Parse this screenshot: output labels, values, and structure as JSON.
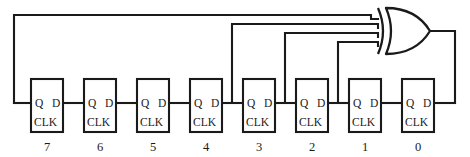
{
  "diagram": {
    "type": "digital-logic-schematic",
    "background_color": "#ffffff",
    "line_color": "#1a1a1a"
  },
  "flipflops": [
    {
      "index_label": "7",
      "q_label": "Q",
      "d_label": "D",
      "clk_label": "CLK"
    },
    {
      "index_label": "6",
      "q_label": "Q",
      "d_label": "D",
      "clk_label": "CLK"
    },
    {
      "index_label": "5",
      "q_label": "Q",
      "d_label": "D",
      "clk_label": "CLK"
    },
    {
      "index_label": "4",
      "q_label": "Q",
      "d_label": "D",
      "clk_label": "CLK"
    },
    {
      "index_label": "3",
      "q_label": "Q",
      "d_label": "D",
      "clk_label": "CLK"
    },
    {
      "index_label": "2",
      "q_label": "Q",
      "d_label": "D",
      "clk_label": "CLK"
    },
    {
      "index_label": "1",
      "q_label": "Q",
      "d_label": "D",
      "clk_label": "CLK"
    },
    {
      "index_label": "0",
      "q_label": "Q",
      "d_label": "D",
      "clk_label": "CLK"
    }
  ],
  "gate": {
    "name": "xor-gate",
    "kind": "XOR",
    "input_count": 4,
    "tap_sources": [
      "7",
      "3",
      "2",
      "1"
    ]
  },
  "geometry": {
    "box_width": 32,
    "box_height": 53,
    "box_top": 79,
    "box_pitch": 53,
    "box_lefts": [
      31,
      84,
      137,
      190,
      243,
      296,
      349,
      402
    ],
    "signal_y": 103,
    "index_label_y": 150,
    "gate_input_ys": [
      19,
      28,
      37,
      46
    ],
    "feedback_top_y": 15,
    "feedback_left_x": 14,
    "output_right_x": 455
  }
}
